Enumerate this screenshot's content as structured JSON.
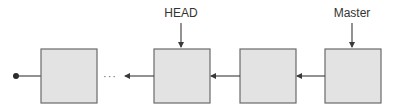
{
  "diagram": {
    "type": "commit-chain",
    "labels": {
      "head": "HEAD",
      "master": "Master"
    },
    "ellipsis": "···",
    "commits": [
      {
        "id": "commit-1",
        "x": 41,
        "y": 49,
        "w": 56,
        "h": 54
      },
      {
        "id": "commit-2",
        "x": 154,
        "y": 49,
        "w": 56,
        "h": 54
      },
      {
        "id": "commit-3",
        "x": 240,
        "y": 49,
        "w": 56,
        "h": 54
      },
      {
        "id": "commit-4",
        "x": 325,
        "y": 49,
        "w": 56,
        "h": 54
      }
    ],
    "pointers": [
      {
        "label": "HEAD",
        "target": "commit-2"
      },
      {
        "label": "Master",
        "target": "commit-4"
      }
    ],
    "colors": {
      "box_fill": "#e3e3e3",
      "box_stroke": "#6a6a6a",
      "line": "#3a3a3a",
      "text": "#333333"
    }
  }
}
